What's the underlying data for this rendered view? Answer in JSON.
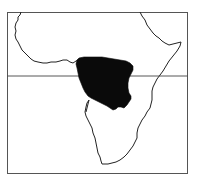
{
  "map": {
    "subject": "Africa",
    "style": "monochrome line map",
    "frame": {
      "x": 7,
      "y": 12,
      "width": 180,
      "height": 161,
      "stroke": "#555555"
    },
    "equator_line": {
      "y": 76,
      "stroke": "#444444"
    },
    "shaded_region": {
      "label": "Central African range (Congo Basin)",
      "fill": "#0a0a0a"
    },
    "coastline": {
      "stroke": "#222222"
    },
    "background": "#ffffff"
  }
}
